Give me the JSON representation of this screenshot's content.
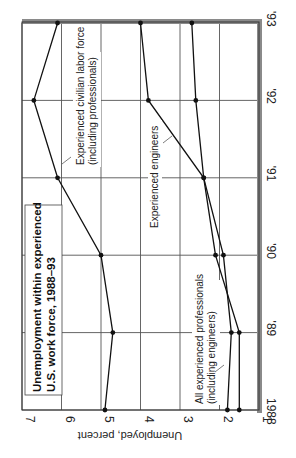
{
  "chart_data": {
    "type": "line",
    "orientation": "rotated-90-clockwise",
    "title": "Unemployment within experienced U.S. work force, 1988–93",
    "title_lines": [
      "Unemployment within experienced",
      "U.S. work force, 1988–93"
    ],
    "xlabel": "",
    "ylabel": "Unemployed, percent",
    "categories": [
      "1988",
      "'89",
      "'90",
      "'91",
      "'92",
      "'93"
    ],
    "ylim": [
      1,
      7
    ],
    "yticks": [
      "1",
      "2",
      "3",
      "4",
      "5",
      "6",
      "7"
    ],
    "grid": true,
    "series": [
      {
        "name": "Experienced civilian labor force (including professionals)",
        "label_lines": [
          "Experienced civilian labor force",
          "(including professionals)"
        ],
        "values": [
          4.9,
          4.7,
          5.0,
          6.1,
          6.7,
          6.1
        ]
      },
      {
        "name": "Experienced engineers",
        "label_lines": [
          "Experienced engineers"
        ],
        "values": [
          1.5,
          1.5,
          2.1,
          2.4,
          3.8,
          4.0
        ]
      },
      {
        "name": "All experienced professionals (including engineers)",
        "label_lines": [
          "All experienced professionals",
          "(including engineers)"
        ],
        "values": [
          1.8,
          1.7,
          1.9,
          2.4,
          2.6,
          2.7
        ]
      }
    ]
  }
}
